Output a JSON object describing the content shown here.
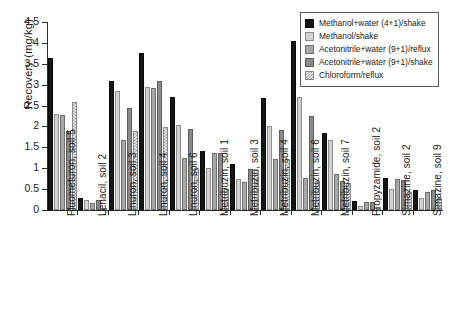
{
  "chart_data": {
    "type": "bar",
    "title": "",
    "xlabel": "",
    "ylabel": "Recovery (mg/kg)",
    "ylim": [
      0,
      4.5
    ],
    "yticks": [
      "0",
      "0.5",
      "1",
      "1.5",
      "2",
      "2.5",
      "3",
      "3.5",
      "4",
      "4.5"
    ],
    "ytick_values": [
      0,
      0.5,
      1,
      1.5,
      2,
      2.5,
      3,
      3.5,
      4,
      4.5
    ],
    "grid": false,
    "legend_position": "top-right",
    "categories": [
      "Fluometuron, soil 5",
      "Lenacil, soil 2",
      "Linuron, soil 3",
      "Linuron, soil 4",
      "Linuron, soil 6",
      "Metribuzin, soil 1",
      "Metribuzin, soil 3",
      "Metribuzin, soil 4",
      "Metribuzin, soil 6",
      "Metribuzin, soil 7",
      "Propyzamide, soil 2",
      "Simazine, soil 2",
      "Simazine, soil 9"
    ],
    "series": [
      {
        "name": "Methanol+water (4+1)/shake",
        "color": "#151515",
        "values": [
          3.65,
          0.29,
          3.1,
          3.76,
          2.7,
          1.41,
          1.11,
          2.68,
          4.04,
          1.85,
          0.21,
          0.77,
          0.48
        ]
      },
      {
        "name": "Methanol/shake",
        "color": "#d2d2d2",
        "values": [
          2.3,
          0.24,
          2.84,
          2.95,
          2.04,
          1.0,
          0.74,
          2.0,
          2.7,
          1.68,
          0.1,
          0.51,
          0.28
        ]
      },
      {
        "name": "Acetonitrile+water (9+1)/reflux",
        "color": "#a8a8a8",
        "values": [
          2.28,
          0.17,
          1.68,
          2.93,
          1.24,
          1.36,
          0.67,
          1.22,
          0.77,
          0.86,
          0.18,
          0.74,
          0.44
        ]
      },
      {
        "name": "Acetonitrile+water (9+1)/shake",
        "color": "#8a8a8a",
        "values": [
          1.9,
          0.23,
          2.45,
          3.1,
          1.94,
          1.36,
          0.98,
          1.91,
          2.25,
          0.7,
          0.19,
          0.72,
          0.48
        ]
      },
      {
        "name": "Chloroform/reflux",
        "color": "#ececec",
        "values": [
          2.58,
          0.06,
          1.88,
          1.98,
          1.0,
          0.5,
          0.95,
          1.21,
          0.69,
          0.65,
          0.07,
          0.44,
          0.29
        ]
      }
    ]
  }
}
